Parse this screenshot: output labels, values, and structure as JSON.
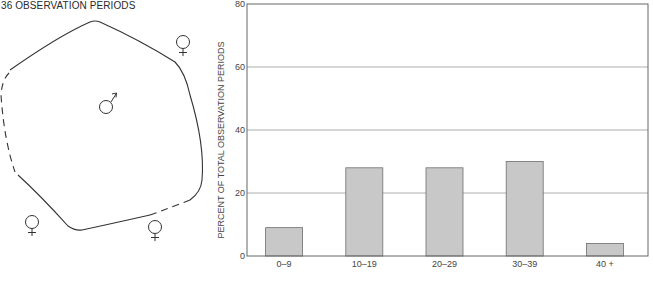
{
  "diagram": {
    "title": "36 OBSERVATION PERIODS",
    "center_symbol": "male",
    "center_symbol_glyph": "♂",
    "outside_symbols": [
      {
        "name": "female-top-right",
        "glyph": "♀"
      },
      {
        "name": "female-bottom-left",
        "glyph": "♀"
      },
      {
        "name": "female-bottom-middle",
        "glyph": "♀"
      }
    ]
  },
  "chart_data": {
    "type": "bar",
    "title": "",
    "xlabel": "",
    "ylabel": "PERCENT OF TOTAL OBSERVATION PERIODS",
    "categories": [
      "0–9",
      "10–19",
      "20–29",
      "30–39",
      "40 +"
    ],
    "values": [
      9,
      28,
      28,
      30,
      4
    ],
    "ylim": [
      0,
      80
    ],
    "yticks": [
      0,
      20,
      40,
      60,
      80
    ],
    "grid": true,
    "legend": "none",
    "bar_color": "#c8c8c8",
    "bar_edge_color": "#6e6e6e",
    "grid_color": "#9a9a9a"
  }
}
